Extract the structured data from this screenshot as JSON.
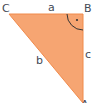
{
  "diagram": {
    "type": "right-triangle",
    "vertices": {
      "C": "C",
      "B": "B",
      "A": "A"
    },
    "sides": {
      "a": "a",
      "b": "b",
      "c": "c"
    },
    "right_angle_mark": "·",
    "colors": {
      "fill": "#F6A572",
      "stroke": "#F08A4B",
      "arc": "#333333",
      "text": "#444a55"
    }
  }
}
